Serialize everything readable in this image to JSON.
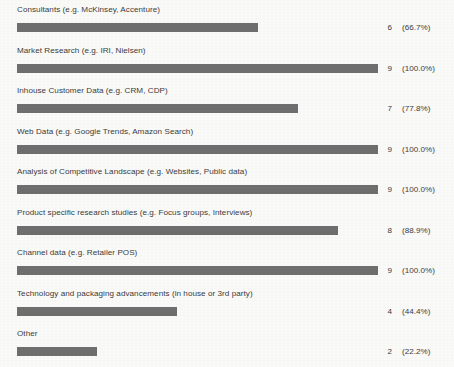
{
  "chart_data": {
    "type": "bar",
    "title": "",
    "subtitle": "",
    "xlabel": "",
    "ylabel": "",
    "orientation": "horizontal",
    "grid": false,
    "legend": null,
    "xlim": [
      0,
      9
    ],
    "max_responses": 9,
    "bar_color": "#6f6f6f",
    "background_color": "#fbfbfa",
    "text_color": "#3c3c3c",
    "categories": [
      "Consultants (e.g. McKinsey, Accenture)",
      "Market Research (e.g. IRI, Nielsen)",
      "Inhouse Customer Data (e.g. CRM, CDP)",
      "Web Data (e.g. Google Trends, Amazon Search)",
      "Analysis of Competitive Landscape (e.g. Websites, Public data)",
      "Product specific research studies (e.g. Focus groups, Interviews)",
      "Channel data (e.g. Retailer POS)",
      "Technology and packaging advancements (in house or 3rd party)",
      "Other"
    ],
    "values": [
      6,
      9,
      7,
      9,
      9,
      8,
      9,
      4,
      2
    ],
    "percent_values": [
      66.7,
      100.0,
      77.8,
      100.0,
      100.0,
      88.9,
      100.0,
      44.4,
      22.2
    ],
    "rows": [
      {
        "label": "Consultants (e.g. McKinsey, Accenture)",
        "count": "6",
        "percent": "(66.7%)",
        "fill": 66.7
      },
      {
        "label": "Market Research (e.g. IRI, Nielsen)",
        "count": "9",
        "percent": "(100.0%)",
        "fill": 100.0
      },
      {
        "label": "Inhouse Customer Data (e.g. CRM, CDP)",
        "count": "7",
        "percent": "(77.8%)",
        "fill": 77.8
      },
      {
        "label": "Web Data (e.g. Google Trends, Amazon Search)",
        "count": "9",
        "percent": "(100.0%)",
        "fill": 100.0
      },
      {
        "label": "Analysis of Competitive Landscape (e.g. Websites, Public data)",
        "count": "9",
        "percent": "(100.0%)",
        "fill": 100.0
      },
      {
        "label": "Product specific research studies (e.g. Focus groups, Interviews)",
        "count": "8",
        "percent": "(88.9%)",
        "fill": 88.9
      },
      {
        "label": "Channel data (e.g. Retailer POS)",
        "count": "9",
        "percent": "(100.0%)",
        "fill": 100.0
      },
      {
        "label": "Technology and packaging advancements (in house or 3rd party)",
        "count": "4",
        "percent": "(44.4%)",
        "fill": 44.4
      },
      {
        "label": "Other",
        "count": "2",
        "percent": "(22.2%)",
        "fill": 22.2
      }
    ]
  }
}
